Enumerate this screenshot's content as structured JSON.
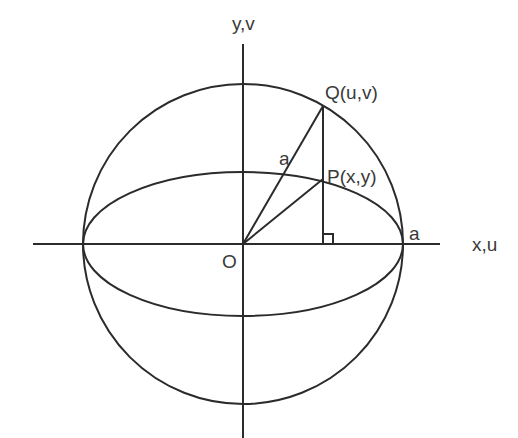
{
  "diagram": {
    "labels": {
      "y_axis": "y,v",
      "x_axis": "x,u",
      "origin": "O",
      "point_q": "Q(u,v)",
      "point_p": "P(x,y)",
      "radius_label": "a",
      "axis_intercept_label": "a"
    },
    "geometry": {
      "origin": [
        243,
        244
      ],
      "circle_radius": 160,
      "ellipse_semi_major": 160,
      "ellipse_semi_minor": 72,
      "point_q": [
        323,
        106
      ],
      "point_p": [
        323,
        179
      ],
      "foot": [
        323,
        244
      ]
    },
    "colors": {
      "stroke": "#2b2b2b",
      "text": "#3a3a3a",
      "background": "#ffffff"
    }
  }
}
